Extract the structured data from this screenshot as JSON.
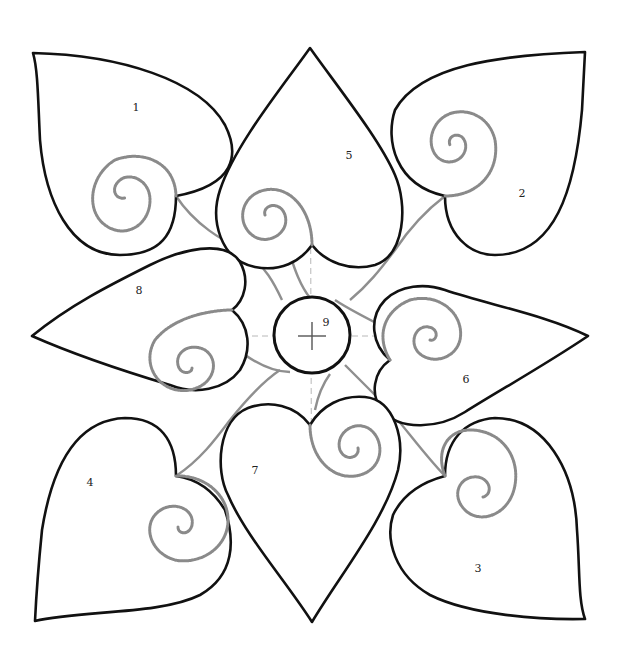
{
  "colors": {
    "outline": "#111111",
    "spiral": "#8a8a8a",
    "guide": "#b8b8b8",
    "background": "#ffffff"
  },
  "pieces": [
    {
      "id": "1",
      "label": "1",
      "x": 136,
      "y": 107
    },
    {
      "id": "2",
      "label": "2",
      "x": 522,
      "y": 193
    },
    {
      "id": "3",
      "label": "3",
      "x": 478,
      "y": 568
    },
    {
      "id": "4",
      "label": "4",
      "x": 90,
      "y": 482
    },
    {
      "id": "5",
      "label": "5",
      "x": 349,
      "y": 155
    },
    {
      "id": "6",
      "label": "6",
      "x": 466,
      "y": 379
    },
    {
      "id": "7",
      "label": "7",
      "x": 255,
      "y": 470
    },
    {
      "id": "8",
      "label": "8",
      "x": 139,
      "y": 290
    },
    {
      "id": "9",
      "label": "9",
      "x": 326,
      "y": 322
    }
  ]
}
